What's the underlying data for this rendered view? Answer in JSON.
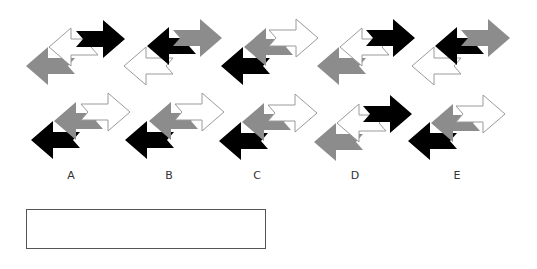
{
  "colors": {
    "black": "#000000",
    "gray": "#8c8c8c",
    "white": "#ffffff",
    "outline": "#9a9a9a"
  },
  "arrow_size": {
    "w": 49,
    "h": 38
  },
  "sequence": {
    "label": "Problem figures",
    "figures": [
      {
        "index": 1,
        "arrows": [
          {
            "fill": "black",
            "dir": "right",
            "x": 75,
            "y": 19
          },
          {
            "fill": "white",
            "dir": "left",
            "x": 48,
            "y": 27
          },
          {
            "fill": "gray",
            "dir": "left",
            "x": 25,
            "y": 46
          }
        ]
      },
      {
        "index": 2,
        "arrows": [
          {
            "fill": "gray",
            "dir": "right",
            "x": 172,
            "y": 18
          },
          {
            "fill": "black",
            "dir": "left",
            "x": 146,
            "y": 26
          },
          {
            "fill": "white",
            "dir": "left",
            "x": 123,
            "y": 46
          }
        ]
      },
      {
        "index": 3,
        "arrows": [
          {
            "fill": "white",
            "dir": "right",
            "x": 268,
            "y": 18
          },
          {
            "fill": "gray",
            "dir": "left",
            "x": 243,
            "y": 27
          },
          {
            "fill": "black",
            "dir": "left",
            "x": 220,
            "y": 46
          }
        ]
      },
      {
        "index": 4,
        "arrows": [
          {
            "fill": "black",
            "dir": "right",
            "x": 365,
            "y": 18
          },
          {
            "fill": "white",
            "dir": "left",
            "x": 339,
            "y": 27
          },
          {
            "fill": "gray",
            "dir": "left",
            "x": 316,
            "y": 46
          }
        ]
      },
      {
        "index": 5,
        "arrows": [
          {
            "fill": "gray",
            "dir": "right",
            "x": 460,
            "y": 18
          },
          {
            "fill": "black",
            "dir": "left",
            "x": 434,
            "y": 26
          },
          {
            "fill": "white",
            "dir": "left",
            "x": 411,
            "y": 46
          }
        ]
      }
    ]
  },
  "options": [
    {
      "label": "A",
      "label_x": 71,
      "arrows": [
        {
          "fill": "white",
          "dir": "right",
          "x": 80,
          "y": 92
        },
        {
          "fill": "gray",
          "dir": "left",
          "x": 53,
          "y": 101
        },
        {
          "fill": "black",
          "dir": "left",
          "x": 30,
          "y": 120
        }
      ]
    },
    {
      "label": "B",
      "label_x": 169,
      "arrows": [
        {
          "fill": "white",
          "dir": "right",
          "x": 174,
          "y": 92
        },
        {
          "fill": "gray",
          "dir": "left",
          "x": 148,
          "y": 101
        },
        {
          "fill": "black",
          "dir": "left",
          "x": 124,
          "y": 120
        }
      ]
    },
    {
      "label": "C",
      "label_x": 257,
      "arrows": [
        {
          "fill": "white",
          "dir": "right",
          "x": 267,
          "y": 93
        },
        {
          "fill": "gray",
          "dir": "left",
          "x": 241,
          "y": 102
        },
        {
          "fill": "black",
          "dir": "left",
          "x": 218,
          "y": 121
        }
      ]
    },
    {
      "label": "D",
      "label_x": 355,
      "arrows": [
        {
          "fill": "black",
          "dir": "right",
          "x": 362,
          "y": 94
        },
        {
          "fill": "white",
          "dir": "left",
          "x": 336,
          "y": 103
        },
        {
          "fill": "gray",
          "dir": "left",
          "x": 313,
          "y": 122
        }
      ]
    },
    {
      "label": "E",
      "label_x": 457,
      "arrows": [
        {
          "fill": "white",
          "dir": "right",
          "x": 455,
          "y": 94
        },
        {
          "fill": "gray",
          "dir": "left",
          "x": 430,
          "y": 103
        },
        {
          "fill": "black",
          "dir": "left",
          "x": 407,
          "y": 121
        }
      ]
    }
  ],
  "labels_y": 169,
  "answer_box": {
    "value": ""
  }
}
